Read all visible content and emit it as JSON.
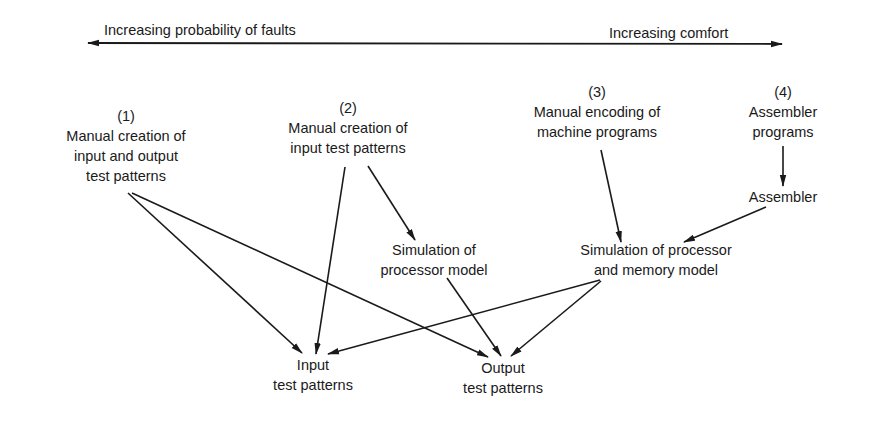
{
  "axis": {
    "left_label": "Increasing probability of faults",
    "right_label": "Increasing comfort"
  },
  "nodes": {
    "n1": {
      "number": "(1)",
      "lines": [
        "Manual creation of",
        "input and output",
        "test patterns"
      ]
    },
    "n2": {
      "number": "(2)",
      "lines": [
        "Manual creation of",
        "input test patterns"
      ]
    },
    "n3": {
      "number": "(3)",
      "lines": [
        "Manual encoding of",
        "machine programs"
      ]
    },
    "n4": {
      "number": "(4)",
      "lines": [
        "Assembler",
        "programs"
      ]
    },
    "assembler": {
      "lines": [
        "Assembler"
      ]
    },
    "sim_proc": {
      "lines": [
        "Simulation of",
        "processor model"
      ]
    },
    "sim_proc_mem": {
      "lines": [
        "Simulation of processor",
        "and memory model"
      ]
    },
    "input_tp": {
      "lines": [
        "Input",
        "test patterns"
      ]
    },
    "output_tp": {
      "lines": [
        "Output",
        "test patterns"
      ]
    }
  },
  "edges": [
    {
      "from": "n1",
      "to": "input_tp"
    },
    {
      "from": "n1",
      "to": "output_tp"
    },
    {
      "from": "n2",
      "to": "input_tp"
    },
    {
      "from": "n2",
      "to": "sim_proc"
    },
    {
      "from": "sim_proc",
      "to": "output_tp"
    },
    {
      "from": "n3",
      "to": "sim_proc_mem"
    },
    {
      "from": "n4",
      "to": "assembler"
    },
    {
      "from": "assembler",
      "to": "sim_proc_mem"
    },
    {
      "from": "sim_proc_mem",
      "to": "input_tp"
    },
    {
      "from": "sim_proc_mem",
      "to": "output_tp"
    }
  ],
  "colors": {
    "ink": "#1a1a1a",
    "background": "#ffffff"
  }
}
